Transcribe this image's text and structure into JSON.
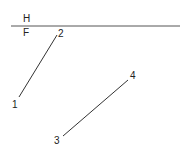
{
  "diagram": {
    "colors": {
      "background": "#ffffff",
      "line": "#333333",
      "text": "#222222"
    },
    "reference_line": {
      "x1": 11,
      "y1": 26,
      "x2": 180,
      "y2": 26,
      "label_above": "H",
      "label_below": "F"
    },
    "segments": [
      {
        "name": "segment-1-2",
        "start": {
          "label": "1",
          "x": 19,
          "y": 97
        },
        "end": {
          "label": "2",
          "x": 57,
          "y": 35
        }
      },
      {
        "name": "segment-3-4",
        "start": {
          "label": "3",
          "x": 63,
          "y": 136
        },
        "end": {
          "label": "4",
          "x": 128,
          "y": 80
        }
      }
    ]
  }
}
